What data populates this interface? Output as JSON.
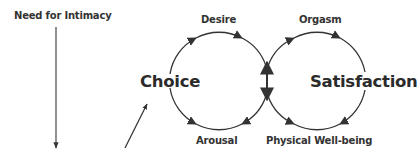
{
  "diagram": {
    "title_label": "Need for Intimacy",
    "left_cycle": {
      "center_label": "Choice",
      "top_label": "Desire",
      "bottom_label": "Arousal"
    },
    "right_cycle": {
      "center_label": "Satisfaction",
      "top_label": "Orgasm",
      "bottom_label": "Physical Well-being"
    },
    "colors": {
      "stroke": "#333333",
      "text": "#333333",
      "background": "#ffffff"
    }
  }
}
